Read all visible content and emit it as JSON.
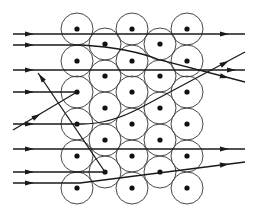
{
  "diagram": {
    "colors": {
      "line": "#1a1a1a",
      "shell": "#333333",
      "nucleus": "#111111",
      "background": "#ffffff"
    },
    "atom_radius": 16,
    "nucleus_radius": 2.6,
    "atoms": [
      {
        "x": 77,
        "y": 29
      },
      {
        "x": 77,
        "y": 61
      },
      {
        "x": 77,
        "y": 92
      },
      {
        "x": 77,
        "y": 124
      },
      {
        "x": 77,
        "y": 156
      },
      {
        "x": 77,
        "y": 188
      },
      {
        "x": 105,
        "y": 44
      },
      {
        "x": 105,
        "y": 76
      },
      {
        "x": 105,
        "y": 108
      },
      {
        "x": 105,
        "y": 140
      },
      {
        "x": 105,
        "y": 172
      },
      {
        "x": 132,
        "y": 29
      },
      {
        "x": 132,
        "y": 61
      },
      {
        "x": 132,
        "y": 92
      },
      {
        "x": 132,
        "y": 124
      },
      {
        "x": 132,
        "y": 156
      },
      {
        "x": 132,
        "y": 188
      },
      {
        "x": 160,
        "y": 44
      },
      {
        "x": 160,
        "y": 76
      },
      {
        "x": 160,
        "y": 108
      },
      {
        "x": 160,
        "y": 140
      },
      {
        "x": 160,
        "y": 172
      },
      {
        "x": 187,
        "y": 29
      },
      {
        "x": 187,
        "y": 61
      },
      {
        "x": 187,
        "y": 92
      },
      {
        "x": 187,
        "y": 124
      },
      {
        "x": 187,
        "y": 156
      },
      {
        "x": 187,
        "y": 188
      }
    ],
    "trajectories": [
      {
        "name": "straight-row-1",
        "d": "M13,34 L245,34",
        "arrows": [
          {
            "x": 30,
            "y": 34,
            "angle": 0
          },
          {
            "x": 225,
            "y": 34,
            "angle": 0
          }
        ]
      },
      {
        "name": "deflected-down",
        "d": "M13,45 L82,45 Q130,48 160,60 L245,82",
        "arrows": [
          {
            "x": 30,
            "y": 45,
            "angle": 0
          },
          {
            "x": 225,
            "y": 77,
            "angle": 14
          }
        ]
      },
      {
        "name": "straight-row-2",
        "d": "M13,70 L245,70",
        "arrows": [
          {
            "x": 30,
            "y": 70,
            "angle": 0
          },
          {
            "x": 232,
            "y": 70,
            "angle": 0
          }
        ]
      },
      {
        "name": "head-on-collision",
        "d": "M13,92 L77,92",
        "arrows": [
          {
            "x": 30,
            "y": 92,
            "angle": 0
          }
        ]
      },
      {
        "name": "backscattered",
        "d": "M105,172 L38,73",
        "arrows": [
          {
            "x": 41,
            "y": 77,
            "angle": 236
          }
        ]
      },
      {
        "name": "incoming-diagonal",
        "d": "M13,130 L77,92",
        "arrows": [
          {
            "x": 37,
            "y": 116,
            "angle": -31
          }
        ]
      },
      {
        "name": "deflected-up",
        "d": "M13,124 L82,124 Q110,124 140,108 L245,52",
        "arrows": [
          {
            "x": 30,
            "y": 124,
            "angle": 0
          },
          {
            "x": 225,
            "y": 63,
            "angle": -28
          }
        ]
      },
      {
        "name": "straight-row-3",
        "d": "M13,149 L245,149",
        "arrows": [
          {
            "x": 30,
            "y": 149,
            "angle": 0
          },
          {
            "x": 225,
            "y": 149,
            "angle": 0
          }
        ]
      },
      {
        "name": "stopped-at-atom",
        "d": "M13,172 L105,172",
        "arrows": [
          {
            "x": 30,
            "y": 172,
            "angle": 0
          }
        ]
      },
      {
        "name": "slight-deflection",
        "d": "M13,183 L80,183 L245,162",
        "arrows": [
          {
            "x": 30,
            "y": 183,
            "angle": 0
          },
          {
            "x": 225,
            "y": 164.5,
            "angle": -7
          }
        ]
      }
    ]
  }
}
